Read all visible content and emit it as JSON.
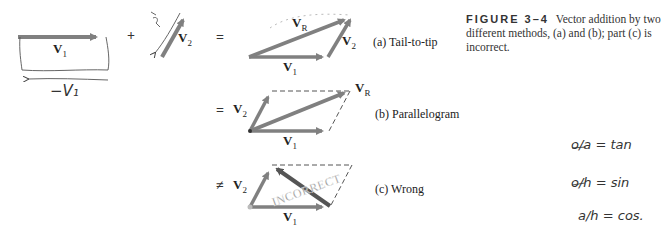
{
  "figure": {
    "number_label": "FIGURE 3–4",
    "caption": "Vector addition by two different methods, (a) and (b); part (c) is incorrect."
  },
  "operators": {
    "plus": "+",
    "equals_a": "=",
    "equals_b": "=",
    "not_equal_c": "≠"
  },
  "vectors": {
    "v1": {
      "base": "V",
      "sub": "1"
    },
    "v2": {
      "base": "V",
      "sub": "2"
    },
    "vr": {
      "base": "V",
      "sub": "R"
    }
  },
  "panels": [
    {
      "label": "(a) Tail-to-tip"
    },
    {
      "label": "(b) Parallelogram"
    },
    {
      "label": "(c) Wrong",
      "stamp": "INCORRECT"
    }
  ],
  "handwritten": {
    "neg_v1": "−V₁",
    "neg_v2": "−V₂",
    "tan": "o/a = tan",
    "sin": "o/h = sin",
    "cos": "a/h = cos."
  },
  "colors": {
    "arrow": "#808080",
    "dark_arrow": "#555555",
    "text": "#222222"
  }
}
